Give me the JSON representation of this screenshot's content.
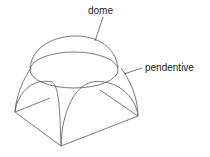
{
  "diagram": {
    "labels": {
      "dome": "dome",
      "pendentive": "pendentive"
    },
    "colors": {
      "line": "#555555",
      "text": "#222222"
    }
  }
}
